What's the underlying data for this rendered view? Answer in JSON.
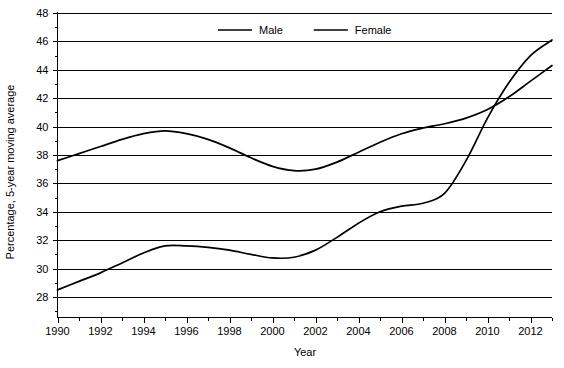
{
  "chart_data": {
    "type": "line",
    "title": "",
    "xlabel": "Year",
    "ylabel": "Percentage, 5-year moving average",
    "xlim": [
      1990,
      2013
    ],
    "ylim": [
      26.5,
      48
    ],
    "grid": true,
    "grid_axis": "y",
    "legend_position": "top-center",
    "y_ticks_major": [
      28,
      30,
      32,
      34,
      36,
      38,
      40,
      42,
      44,
      46,
      48
    ],
    "y_ticks_minor": [
      27,
      29,
      31,
      33,
      35,
      37,
      39,
      41,
      43,
      45,
      47
    ],
    "x_ticks_major": [
      1990,
      1992,
      1994,
      1996,
      1998,
      2000,
      2002,
      2004,
      2006,
      2008,
      2010,
      2012
    ],
    "x_ticks_minor": [
      1991,
      1993,
      1995,
      1997,
      1999,
      2001,
      2003,
      2005,
      2007,
      2009,
      2011,
      2013
    ],
    "x": [
      1990,
      1991,
      1992,
      1993,
      1994,
      1995,
      1996,
      1997,
      1998,
      1999,
      2000,
      2001,
      2002,
      2003,
      2004,
      2005,
      2006,
      2007,
      2008,
      2009,
      2010,
      2011,
      2012,
      2013
    ],
    "series": [
      {
        "name": "Male",
        "color": "#000000",
        "values": [
          37.6,
          38.1,
          38.6,
          39.1,
          39.5,
          39.7,
          39.5,
          39.1,
          38.5,
          37.8,
          37.2,
          36.9,
          37.0,
          37.5,
          38.2,
          38.9,
          39.5,
          39.9,
          40.2,
          40.6,
          41.2,
          42.1,
          43.2,
          44.3
        ]
      },
      {
        "name": "Female",
        "color": "#000000",
        "values": [
          28.5,
          29.1,
          29.7,
          30.4,
          31.1,
          31.6,
          31.6,
          31.5,
          31.3,
          31.0,
          30.75,
          30.8,
          31.3,
          32.2,
          33.2,
          34.0,
          34.4,
          34.6,
          35.3,
          37.6,
          40.6,
          43.1,
          45.0,
          46.1
        ]
      }
    ],
    "legend": [
      {
        "label": "Male"
      },
      {
        "label": "Female"
      }
    ]
  },
  "axis": {
    "y_title": "Percentage, 5-year moving average",
    "x_title": "Year",
    "y_labels": [
      "48",
      "46",
      "44",
      "42",
      "40",
      "38",
      "36",
      "34",
      "32",
      "30",
      "28"
    ],
    "x_labels": [
      "1990",
      "1992",
      "1994",
      "1996",
      "1998",
      "2000",
      "2002",
      "2004",
      "2006",
      "2008",
      "2010",
      "2012"
    ]
  }
}
